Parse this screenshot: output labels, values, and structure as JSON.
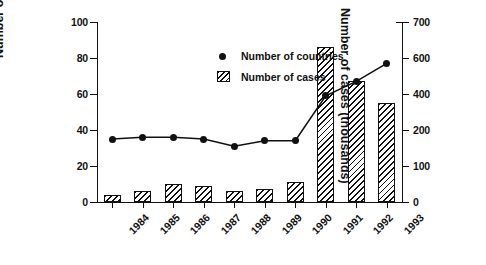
{
  "chart_data": {
    "type": "bar",
    "title": "",
    "categories": [
      "1984",
      "1985",
      "1986",
      "1987",
      "1988",
      "1989",
      "1990",
      "1991",
      "1992",
      "1993"
    ],
    "xlabel": "",
    "ylabel": "Number of countries",
    "y2label": "Number of cases (thousands)",
    "ylim": [
      0,
      100
    ],
    "y2lim": [
      0,
      700
    ],
    "yticks": [
      "0",
      "20",
      "40",
      "60",
      "80",
      "100"
    ],
    "ytick_values": [
      0,
      20,
      40,
      60,
      80,
      100
    ],
    "y2ticks": [
      "0",
      "100",
      "200",
      "400",
      "600",
      "700"
    ],
    "y2tick_values": [
      0,
      100,
      200,
      400,
      600,
      700
    ],
    "grid": false,
    "legend_position": "upper-left-inside",
    "series": [
      {
        "name": "Number of countries",
        "marker": "filled-circle",
        "type": "line",
        "axis": "left",
        "values": [
          35,
          36,
          36,
          35,
          31,
          34,
          34,
          59,
          67,
          77
        ]
      },
      {
        "name": "Number of cases",
        "marker": "hatched-bar",
        "type": "bar",
        "axis": "right",
        "values_left_scale": [
          4,
          6,
          10,
          9,
          6,
          7,
          11,
          86,
          67,
          55
        ],
        "values": [
          28,
          42,
          70,
          63,
          42,
          49,
          77,
          602,
          469,
          385
        ]
      }
    ]
  },
  "legend": {
    "items": [
      {
        "label": "Number of countries",
        "marker": "dot"
      },
      {
        "label": "Number of cases",
        "marker": "hatch-box"
      }
    ]
  },
  "axes": {
    "left_title": "Number of countries",
    "right_title": "Number of cases (thousands)"
  }
}
